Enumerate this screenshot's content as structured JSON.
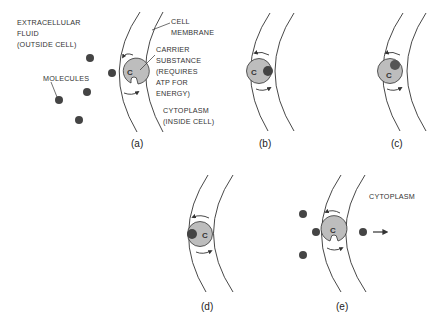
{
  "labels": {
    "extracellular": [
      "EXTRACELLULAR",
      "FLUID",
      "(OUTSIDE CELL)"
    ],
    "membrane": [
      "CELL",
      "MEMBRANE"
    ],
    "carrier": [
      "CARRIER",
      "SUBSTANCE",
      "(REQUIRES",
      "ATP FOR",
      "ENERGY)"
    ],
    "molecules": "MOLECULES",
    "cytoplasm_a": [
      "CYTOPLASM",
      "(INSIDE CELL)"
    ],
    "cytoplasm_e": "CYTOPLASM",
    "carrier_letter": "C"
  },
  "panels": [
    {
      "id": "a",
      "label": "(a)"
    },
    {
      "id": "b",
      "label": "(b)"
    },
    {
      "id": "c",
      "label": "(c)"
    },
    {
      "id": "d",
      "label": "(d)"
    },
    {
      "id": "e",
      "label": "(e)"
    }
  ],
  "colors": {
    "carrier_fill": "#bdbdbd",
    "molecule_fill": "#444444",
    "line": "#333333"
  }
}
